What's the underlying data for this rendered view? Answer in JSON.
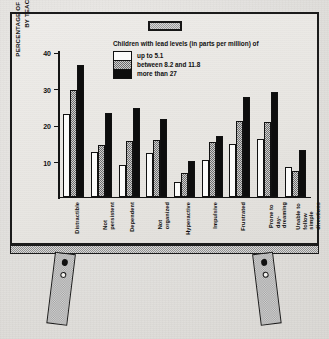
{
  "chart_data": {
    "type": "bar",
    "title": "",
    "legend_title": "Children with lead levels (in parts per million) of",
    "legend_position": "top-center",
    "xlabel": "",
    "ylabel": "PERCENTAGE OF CHILDREN REPORTED\nBY TEACHERS TO BE:",
    "ylim": [
      0,
      40
    ],
    "yticks": [
      10,
      20,
      30,
      40
    ],
    "ytick_labels": [
      "10",
      "20",
      "30",
      "40"
    ],
    "grid": false,
    "categories": [
      "Distractible",
      "Not persistent",
      "Dependent",
      "Not organized",
      "Hyperactive",
      "Impulsive",
      "Frustrated",
      "Prone to\nday-dreaming",
      "Unable to follow\nsimple directions"
    ],
    "series": [
      {
        "name": "up to 5.1",
        "color": "#fbfbfa",
        "values": [
          22.5,
          12.2,
          8.6,
          12.0,
          4.0,
          9.9,
          14.4,
          15.7,
          8.1
        ]
      },
      {
        "name": "between 8.2 and 11.8",
        "color": "#8a8a8a",
        "values": [
          29.1,
          14.0,
          15.1,
          15.5,
          6.5,
          14.8,
          20.8,
          20.3,
          7.0
        ]
      },
      {
        "name": "more than 27",
        "color": "#0d0d0d",
        "values": [
          36.0,
          22.8,
          24.2,
          21.3,
          9.8,
          16.6,
          27.4,
          28.6,
          12.8
        ]
      }
    ]
  },
  "easel": {
    "clip_label": "clip",
    "left_leg_label": "left-leg",
    "right_leg_label": "right-leg"
  }
}
